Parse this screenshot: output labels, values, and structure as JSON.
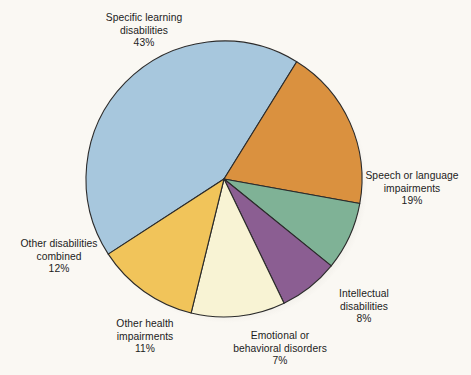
{
  "background_color": "#faf8f3",
  "chart_data": {
    "type": "pie",
    "title": "",
    "subtitle": "",
    "xlabel": "",
    "ylabel": "",
    "legend_position": "none",
    "grid": false,
    "value_unit": "%",
    "categories": [
      "Specific learning disabilities",
      "Speech or language impairments",
      "Intellectual disabilities",
      "Emotional or behavioral disorders",
      "Other health impairments",
      "Other disabilities combined"
    ],
    "values": [
      43,
      19,
      8,
      7,
      11,
      12
    ],
    "colors": [
      "#a7c7dd",
      "#da913f",
      "#7fb296",
      "#8b5e92",
      "#f8f3d4",
      "#f1c45a"
    ],
    "slices": [
      {
        "label": "Specific learning disabilities",
        "label_line_1": "Specific learning",
        "label_line_2": "disabilities",
        "value": 43,
        "value_text": "43%",
        "color": "#a7c7dd"
      },
      {
        "label": "Speech or language impairments",
        "label_line_1": "Speech or language",
        "label_line_2": "impairments",
        "value": 19,
        "value_text": "19%",
        "color": "#da913f"
      },
      {
        "label": "Intellectual disabilities",
        "label_line_1": "Intellectual",
        "label_line_2": "disabilities",
        "value": 8,
        "value_text": "8%",
        "color": "#7fb296"
      },
      {
        "label": "Emotional or behavioral disorders",
        "label_line_1": "Emotional or",
        "label_line_2": "behavioral disorders",
        "value": 7,
        "value_text": "7%",
        "color": "#8b5e92"
      },
      {
        "label": "Other health impairments",
        "label_line_1": "Other health",
        "label_line_2": "impairments",
        "value": 11,
        "value_text": "11%",
        "color": "#f8f3d4"
      },
      {
        "label": "Other disabilities combined",
        "label_line_1": "Other disabilities",
        "label_line_2": "combined",
        "value": 12,
        "value_text": "12%",
        "color": "#f1c45a"
      }
    ]
  }
}
